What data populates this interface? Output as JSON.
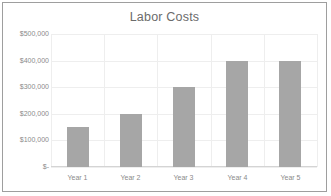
{
  "chart_data": {
    "type": "bar",
    "title": "Labor Costs",
    "xlabel": "",
    "ylabel": "",
    "categories": [
      "Year 1",
      "Year 2",
      "Year 3",
      "Year 4",
      "Year 5"
    ],
    "values": [
      150000,
      200000,
      300000,
      400000,
      400000
    ],
    "ylim": [
      0,
      500000
    ],
    "ytick_values": [
      0,
      100000,
      200000,
      300000,
      400000,
      500000
    ],
    "ytick_labels": [
      "$-",
      "$100,000",
      "$200,000",
      "$300,000",
      "$400,000",
      "$500,000"
    ],
    "grid": true,
    "grid_axes": "both",
    "legend": false,
    "series": [
      {
        "name": "Labor Costs",
        "values": [
          150000,
          200000,
          300000,
          400000,
          400000
        ],
        "color": "#a6a6a6"
      }
    ]
  },
  "style": {
    "bar_color": "#a6a6a6",
    "gridline_color": "#eeeeee",
    "axis_line_color": "#d4d4d4",
    "border_color": "#9e9e9e",
    "title_color": "#6b6b6b",
    "tick_label_color": "#8a8a8a",
    "background": "#ffffff"
  }
}
